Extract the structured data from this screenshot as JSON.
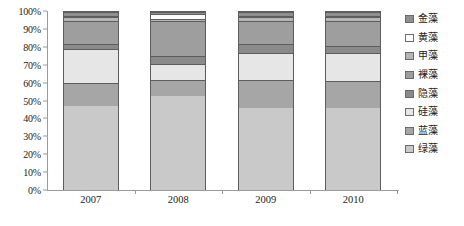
{
  "chart_data": {
    "type": "bar",
    "stacked": true,
    "normalized_percent": true,
    "title": "",
    "xlabel": "",
    "ylabel": "",
    "categories": [
      "2007",
      "2008",
      "2009",
      "2010"
    ],
    "ylim": [
      0,
      100
    ],
    "ytick_labels": [
      "0%",
      "10%",
      "20%",
      "30%",
      "40%",
      "50%",
      "60%",
      "70%",
      "80%",
      "90%",
      "100%"
    ],
    "ytick_values": [
      0,
      10,
      20,
      30,
      40,
      50,
      60,
      70,
      80,
      90,
      100
    ],
    "grid": false,
    "legend_position": "right",
    "series": [
      {
        "name": "绿藻",
        "color": "#c9c9c9",
        "values": [
          47,
          53,
          46,
          46
        ]
      },
      {
        "name": "蓝藻",
        "color": "#a6a6a6",
        "values": [
          13,
          9,
          16,
          15
        ]
      },
      {
        "name": "硅藻",
        "color": "#e6e6e6",
        "values": [
          19,
          9,
          15,
          16
        ]
      },
      {
        "name": "隐藻",
        "color": "#8a8a8a",
        "values": [
          3,
          4,
          5,
          4
        ]
      },
      {
        "name": "裸藻",
        "color": "#9e9e9e",
        "values": [
          13,
          20,
          13,
          14
        ]
      },
      {
        "name": "甲藻",
        "color": "#b5b5b5",
        "values": [
          2,
          1,
          2,
          2
        ]
      },
      {
        "name": "黄藻",
        "color": "#fbfbfb",
        "values": [
          1,
          3,
          1,
          1
        ]
      },
      {
        "name": "金藻",
        "color": "#8f8f8f",
        "values": [
          2,
          1,
          2,
          2
        ]
      }
    ]
  },
  "legend": {
    "items": [
      {
        "label": "金藻",
        "color": "#8f8f8f"
      },
      {
        "label": "黄藻",
        "color": "#fbfbfb"
      },
      {
        "label": "甲藻",
        "color": "#b5b5b5"
      },
      {
        "label": "裸藻",
        "color": "#9e9e9e"
      },
      {
        "label": "隐藻",
        "color": "#8a8a8a"
      },
      {
        "label": "硅藻",
        "color": "#e6e6e6"
      },
      {
        "label": "蓝藻",
        "color": "#a6a6a6"
      },
      {
        "label": "绿藻",
        "color": "#c9c9c9"
      }
    ]
  }
}
